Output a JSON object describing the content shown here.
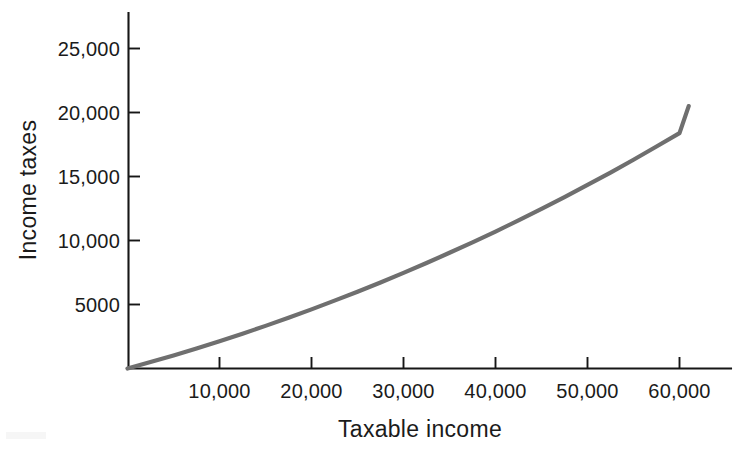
{
  "chart_data": {
    "type": "line",
    "title": "",
    "subtitle": "",
    "xlabel": "Taxable income",
    "ylabel": "Income taxes",
    "xlim": [
      0,
      65500
    ],
    "ylim": [
      0,
      28500
    ],
    "grid": false,
    "legend": false,
    "legend_position": "none",
    "xticks": [
      10000,
      20000,
      30000,
      40000,
      50000,
      60000
    ],
    "xtick_labels": [
      "10,000",
      "20,000",
      "30,000",
      "40,000",
      "50,000",
      "60,000"
    ],
    "yticks": [
      5000,
      10000,
      15000,
      20000,
      25000
    ],
    "ytick_labels": [
      "5000",
      "10,000",
      "15,000",
      "20,000",
      "25,000"
    ],
    "series": [
      {
        "name": "Income taxes",
        "color": "#6f6f6f",
        "x": [
          0,
          2500,
          5000,
          7500,
          10000,
          12500,
          15000,
          17500,
          20000,
          22500,
          25000,
          27500,
          30000,
          32500,
          35000,
          37500,
          40000,
          42500,
          45000,
          47500,
          50000,
          52500,
          55000,
          57500,
          60000,
          61000
        ],
        "values": [
          0,
          500,
          1020,
          1570,
          2130,
          2720,
          3330,
          3960,
          4620,
          5300,
          6000,
          6720,
          7470,
          8240,
          9040,
          9860,
          10700,
          11570,
          12470,
          13390,
          14340,
          15310,
          16310,
          17340,
          18390,
          20500
        ]
      }
    ]
  },
  "axes": {
    "x_axis_name": "x-axis",
    "y_axis_name": "y-axis"
  },
  "colors": {
    "curve": "#6f6f6f",
    "axis": "#161616",
    "text": "#1b1b1b",
    "background": "#ffffff"
  }
}
